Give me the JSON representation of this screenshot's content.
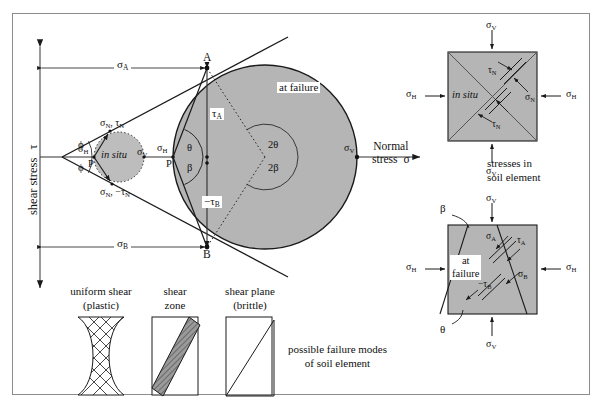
{
  "figure": {
    "background_color": "#ffffff",
    "border_color": "#8c8c8c",
    "fill_gray": "#b3b3b3",
    "line_color": "#1a1a1a"
  },
  "axes": {
    "y_label_text": "shear stress",
    "y_label_symbol": "τ",
    "x_label_line1": "Normal",
    "x_label_line2": "stress",
    "x_label_symbol": "σ"
  },
  "mohr": {
    "circle_failure_label": "at failure",
    "circle_insitu_label": "in situ",
    "point_a": "A",
    "point_b": "B",
    "pole_left": "P",
    "pole_insitu": "P",
    "sigma_a": "σ",
    "sigma_a_sub": "A",
    "sigma_b": "σ",
    "sigma_b_sub": "B",
    "sigma_h": "σ",
    "sigma_h_sub": "H",
    "sigma_v": "σ",
    "sigma_v_sub": "V",
    "sigma_n": "σ",
    "sigma_n_sub": "N",
    "tau_a": "τ",
    "tau_a_sub": "A",
    "tau_b_neg": "−τ",
    "tau_b_sub": "B",
    "tau_n": "τ",
    "tau_n_sub": "N",
    "tau_n_neg": "−τ",
    "sigma_n_tau_n": "σ",
    "angle_phi_upper": "ϕ",
    "angle_phi_lower": "ϕ",
    "angle_theta": "θ",
    "angle_beta": "β",
    "angle_two_theta": "2θ",
    "angle_two_beta": "2β"
  },
  "soil_elements": {
    "caption_line1": "stresses in",
    "caption_line2": "soil element",
    "top": {
      "label": "in situ",
      "sigma_v_top": "σ",
      "sigma_v_top_sub": "V",
      "sigma_v_bottom": "σ",
      "sigma_v_bottom_sub": "V",
      "sigma_h_left": "σ",
      "sigma_h_left_sub": "H",
      "sigma_h_right": "σ",
      "sigma_h_right_sub": "H",
      "sigma_n": "σ",
      "sigma_n_sub": "N",
      "tau_n_top": "τ",
      "tau_n_top_sub": "N",
      "tau_n_bottom": "τ",
      "tau_n_bottom_sub": "N"
    },
    "bottom": {
      "label_line1": "at",
      "label_line2": "failure",
      "sigma_v_top": "σ",
      "sigma_v_top_sub": "V",
      "sigma_v_bottom": "σ",
      "sigma_v_bottom_sub": "V",
      "sigma_h_left": "σ",
      "sigma_h_left_sub": "H",
      "sigma_h_right": "σ",
      "sigma_h_right_sub": "H",
      "sigma_a": "σ",
      "sigma_a_sub": "A",
      "sigma_b": "σ",
      "sigma_b_sub": "B",
      "tau_a": "τ",
      "tau_a_sub": "A",
      "tau_b_neg": "−τ",
      "tau_b_sub": "B",
      "angle_beta": "β",
      "angle_theta": "θ"
    }
  },
  "failure_modes": {
    "caption_line1": "possible failure modes",
    "caption_line2": "of soil element",
    "modes": [
      {
        "line1": "uniform shear",
        "line2": "(plastic)"
      },
      {
        "line1": "shear",
        "line2": "zone"
      },
      {
        "line1": "shear plane",
        "line2": "(brittle)"
      }
    ]
  }
}
